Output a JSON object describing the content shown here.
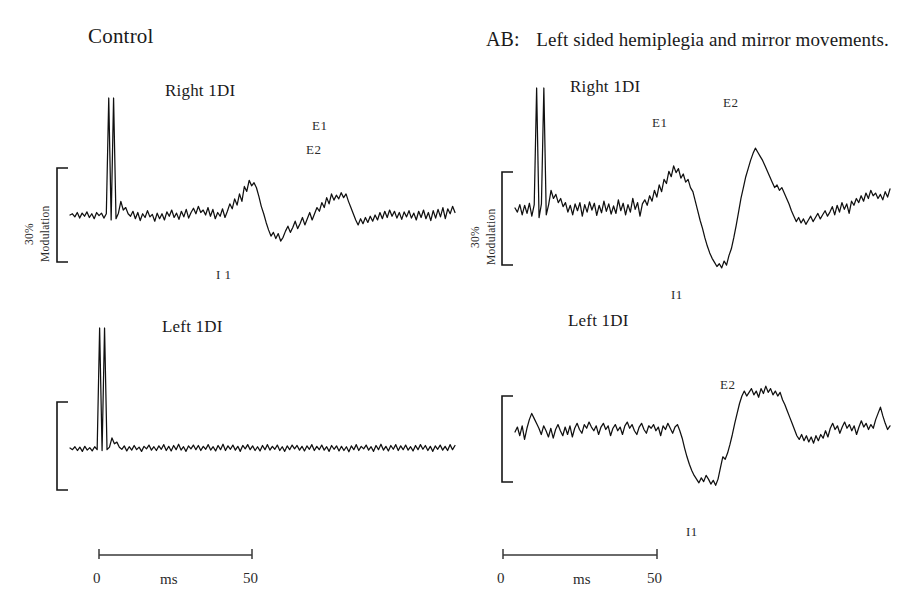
{
  "figure": {
    "columns": [
      {
        "id": "control",
        "title": "Control"
      },
      {
        "id": "ab",
        "case_id": "AB:",
        "title": "Left sided hemiplegia and mirror movements."
      }
    ],
    "scale_bar": {
      "amplitude_label_top": "30%",
      "amplitude_label_bottom": "Modulation"
    },
    "time_axis": {
      "start_label": "0",
      "unit_label": "ms",
      "end_label": "50"
    }
  },
  "panels": [
    {
      "id": "control-right-1di",
      "trace_title": "Right 1DI",
      "peaks": [
        {
          "name": "E1",
          "label": "E1"
        },
        {
          "name": "I1",
          "label": "I 1"
        },
        {
          "name": "E2",
          "label": "E2"
        }
      ]
    },
    {
      "id": "control-left-1di",
      "trace_title": "Left 1DI",
      "peaks": []
    },
    {
      "id": "ab-right-1di",
      "trace_title": "Right 1DI",
      "peaks": [
        {
          "name": "E1",
          "label": "E1"
        },
        {
          "name": "I1",
          "label": "I1"
        },
        {
          "name": "E2",
          "label": "E2"
        }
      ]
    },
    {
      "id": "ab-left-1di",
      "trace_title": "Left 1DI",
      "peaks": [
        {
          "name": "I1",
          "label": "I1"
        },
        {
          "name": "E2",
          "label": "E2"
        }
      ]
    }
  ],
  "chart_data": {
    "type": "line",
    "xlabel": "ms",
    "ylabel": "Modulation",
    "xlim": [
      -12,
      62
    ],
    "ylim": [
      -60,
      120
    ],
    "grid": false,
    "legend": "none",
    "y_scale_bar_percent": 30,
    "x_ticks": [
      0,
      50
    ],
    "series": [
      {
        "name": "Control - Right 1DI",
        "panel": "control-right-1di",
        "annotations": [
          {
            "label": "E1",
            "x": 27,
            "y": 52
          },
          {
            "label": "I 1",
            "x": 38,
            "y": -42
          },
          {
            "label": "E2",
            "x": 47,
            "y": 38
          }
        ],
        "stimulus_artifact_x": [
          0.6,
          2.2
        ],
        "values": [
          0,
          2,
          -3,
          4,
          -5,
          3,
          -2,
          5,
          -4,
          2,
          -6,
          4,
          -1,
          3,
          -5,
          2,
          100,
          -8,
          102,
          -6,
          3,
          22,
          8,
          12,
          2,
          -2,
          6,
          -6,
          4,
          -9,
          2,
          -4,
          7,
          -3,
          1,
          -10,
          3,
          -6,
          2,
          -8,
          5,
          -2,
          8,
          -4,
          3,
          -7,
          6,
          -3,
          9,
          -5,
          4,
          11,
          2,
          14,
          4,
          8,
          0,
          12,
          -2,
          9,
          -6,
          4,
          -2,
          10,
          -4,
          6,
          18,
          10,
          26,
          16,
          34,
          22,
          46,
          38,
          56,
          47,
          52,
          44,
          30,
          14,
          2,
          -12,
          -24,
          -34,
          -28,
          -38,
          -30,
          -42,
          -36,
          -26,
          -18,
          -28,
          -20,
          -10,
          -22,
          -14,
          -4,
          -16,
          -6,
          4,
          -8,
          2,
          12,
          6,
          20,
          12,
          28,
          18,
          34,
          24,
          32,
          26,
          36,
          28,
          34,
          22,
          12,
          2,
          -8,
          -16,
          -6,
          -14,
          -4,
          -12,
          -2,
          -10,
          0,
          -8,
          4,
          -6,
          6,
          -4,
          8,
          -2,
          6,
          -5,
          4,
          -7,
          5,
          -3,
          7,
          -5,
          3,
          -8,
          6,
          -4,
          8,
          -6,
          4,
          -9,
          7,
          -5,
          9,
          -3,
          12,
          -6,
          10,
          2,
          14,
          4
        ]
      },
      {
        "name": "Control - Left 1DI",
        "panel": "control-left-1di",
        "annotations": [],
        "stimulus_artifact_x": [
          0.6,
          2.2
        ],
        "values": [
          0,
          -4,
          3,
          -6,
          2,
          -8,
          4,
          -5,
          1,
          -7,
          3,
          -4,
          100,
          -6,
          102,
          -4,
          2,
          24,
          10,
          14,
          2,
          -3,
          5,
          -7,
          3,
          -5,
          6,
          -4,
          2,
          -8,
          4,
          -2,
          7,
          -5,
          3,
          -6,
          5,
          -3,
          8,
          -6,
          4,
          -7,
          6,
          -4,
          9,
          -5,
          3,
          -8,
          5,
          -2,
          7,
          -4,
          6,
          -6,
          4,
          -3,
          8,
          -5,
          3,
          -7,
          6,
          -4,
          9,
          -6,
          5,
          -3,
          7,
          -5,
          4,
          -8,
          6,
          -2,
          8,
          -4,
          5,
          -6,
          3,
          -7,
          6,
          -4,
          8,
          -5,
          4,
          -3,
          7,
          -6,
          3,
          -8,
          5,
          -4,
          7,
          -2,
          6,
          -5,
          4,
          -7,
          5,
          -3,
          8,
          -6,
          4,
          -4,
          7,
          -5,
          3,
          -8,
          6,
          -3,
          5,
          -7,
          4,
          -6,
          3,
          -9,
          5,
          -4,
          8,
          -6,
          4,
          -2,
          7,
          -5,
          3,
          -8,
          6,
          -4,
          9,
          -5,
          4,
          -7,
          6,
          -3,
          8,
          -6,
          5,
          -4,
          7,
          -5,
          3,
          -7,
          6,
          -4,
          8,
          -3,
          6,
          -6,
          4,
          -8,
          5,
          -3,
          7,
          -5,
          4,
          -6,
          8,
          -4,
          6
        ]
      },
      {
        "name": "AB - Right 1DI",
        "panel": "ab-right-1di",
        "annotations": [
          {
            "label": "E1",
            "x": 26,
            "y": 60
          },
          {
            "label": "I1",
            "x": 38,
            "y": -72
          },
          {
            "label": "E2",
            "x": 46,
            "y": 88
          }
        ],
        "stimulus_artifact_x": [
          1.0,
          2.6
        ],
        "values": [
          0,
          -6,
          5,
          -10,
          4,
          -8,
          7,
          -12,
          5,
          100,
          -14,
          6,
          102,
          -10,
          5,
          26,
          14,
          20,
          8,
          14,
          2,
          8,
          -6,
          4,
          -10,
          6,
          -4,
          8,
          -12,
          5,
          -6,
          9,
          -3,
          7,
          -11,
          4,
          -7,
          10,
          -5,
          6,
          -9,
          3,
          -8,
          12,
          -4,
          7,
          -10,
          5,
          -6,
          14,
          -2,
          8,
          -12,
          6,
          12,
          4,
          18,
          10,
          26,
          16,
          34,
          24,
          42,
          36,
          54,
          46,
          62,
          52,
          58,
          44,
          50,
          38,
          42,
          30,
          24,
          10,
          -4,
          -18,
          -30,
          -44,
          -56,
          -66,
          -74,
          -80,
          -86,
          -82,
          -88,
          -78,
          -84,
          -70,
          -60,
          -44,
          -26,
          -6,
          14,
          30,
          46,
          58,
          70,
          80,
          88,
          82,
          76,
          70,
          62,
          54,
          46,
          38,
          30,
          34,
          26,
          30,
          22,
          14,
          6,
          -4,
          -12,
          -20,
          -14,
          -22,
          -16,
          -24,
          -18,
          -12,
          -20,
          -14,
          -8,
          -16,
          -10,
          -4,
          -12,
          -6,
          2,
          -10,
          4,
          -6,
          8,
          -2,
          6,
          -8,
          10,
          4,
          14,
          8,
          18,
          10,
          22,
          14,
          26,
          18,
          22,
          14,
          20,
          12,
          24,
          16,
          28
        ]
      },
      {
        "name": "AB - Left 1DI",
        "panel": "ab-left-1di",
        "annotations": [
          {
            "label": "I1",
            "x": 37,
            "y": -78
          },
          {
            "label": "E2",
            "x": 46,
            "y": 72
          }
        ],
        "stimulus_artifact_x": [],
        "values": [
          0,
          8,
          -6,
          10,
          -12,
          6,
          20,
          30,
          22,
          14,
          6,
          -4,
          10,
          2,
          -8,
          6,
          -10,
          4,
          12,
          2,
          -6,
          8,
          -4,
          10,
          -8,
          6,
          14,
          4,
          -2,
          12,
          6,
          16,
          8,
          2,
          10,
          -4,
          8,
          14,
          4,
          10,
          -6,
          6,
          12,
          2,
          8,
          -4,
          10,
          16,
          6,
          12,
          2,
          -4,
          8,
          14,
          4,
          -2,
          10,
          6,
          12,
          2,
          8,
          -6,
          10,
          4,
          14,
          6,
          -2,
          8,
          12,
          2,
          -10,
          -26,
          -40,
          -52,
          -62,
          -70,
          -76,
          -82,
          -74,
          -80,
          -70,
          -76,
          -84,
          -78,
          -86,
          -76,
          -58,
          -40,
          -44,
          -34,
          -20,
          -4,
          14,
          30,
          46,
          58,
          66,
          58,
          64,
          70,
          60,
          66,
          56,
          70,
          62,
          74,
          64,
          70,
          60,
          66,
          58,
          64,
          52,
          44,
          34,
          24,
          14,
          4,
          -6,
          -12,
          -4,
          -14,
          -6,
          -16,
          -8,
          -18,
          -6,
          -14,
          -4,
          -10,
          2,
          -8,
          6,
          14,
          4,
          10,
          -2,
          8,
          16,
          6,
          12,
          2,
          10,
          -4,
          8,
          18,
          8,
          14,
          4,
          12,
          6,
          20,
          30,
          40,
          26,
          14,
          4,
          10
        ]
      }
    ]
  }
}
